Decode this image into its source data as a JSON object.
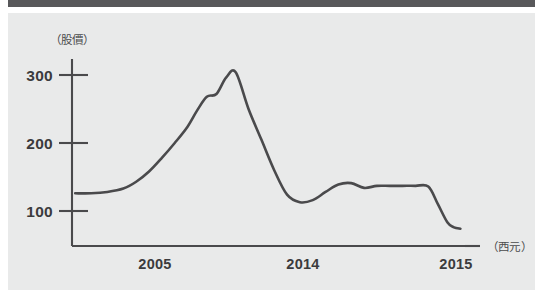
{
  "figure": {
    "background_color": "#e9eaea",
    "page_background": "#ffffff",
    "rule_color": "#58585a",
    "line_color": "#4a4a4c",
    "axis_color": "#4a4a4c",
    "text_color": "#3b3b3d"
  },
  "chart_data": {
    "type": "line",
    "title": "",
    "subtitle": "",
    "xlabel": "（西元）",
    "ylabel": "（股價）",
    "ylim": [
      0,
      340
    ],
    "xlim": [
      2003.2,
      2015.6
    ],
    "grid": false,
    "legend": null,
    "y_ticks": [
      100,
      200,
      300
    ],
    "y_tick_labels": [
      "100",
      "200",
      "300"
    ],
    "x_ticks": [
      2005,
      2014,
      2015
    ],
    "x_tick_labels": [
      "2005",
      "2014",
      "2015"
    ],
    "series": [
      {
        "name": "股價",
        "x": [
          2003.3,
          2003.8,
          2004.3,
          2004.8,
          2005.2,
          2005.6,
          2006.0,
          2006.4,
          2006.8,
          2007.1,
          2007.4,
          2007.7,
          2008.0,
          2008.3,
          2008.7,
          2009.1,
          2009.5,
          2009.9,
          2010.3,
          2010.7,
          2011.1,
          2011.5,
          2011.9,
          2012.3,
          2012.7,
          2013.1,
          2013.5,
          2013.9,
          2014.3,
          2014.6,
          2014.9,
          2015.1,
          2015.3
        ],
        "y": [
          126,
          126,
          128,
          133,
          143,
          158,
          178,
          200,
          224,
          248,
          268,
          272,
          296,
          304,
          250,
          205,
          160,
          124,
          113,
          116,
          128,
          139,
          141,
          134,
          137,
          137,
          137,
          137,
          136,
          110,
          83,
          76,
          74
        ]
      }
    ],
    "annotations": {
      "peak_value": 304,
      "start_value": 126,
      "trough_value": 113,
      "plateau_value": 137,
      "end_value": 74
    }
  }
}
